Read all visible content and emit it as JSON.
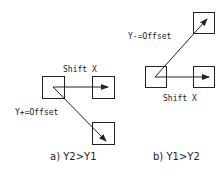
{
  "panels": [
    {
      "id": "a",
      "caption": "a) Y2>Y1",
      "shift_label": "Shift X",
      "offset_label": "Y+=Offset"
    },
    {
      "id": "b",
      "caption": "b) Y1>Y2",
      "shift_label": "Shift X",
      "offset_label": "Y-=Offset"
    }
  ],
  "colors": {
    "stroke": "#222222",
    "background": "#ffffff"
  }
}
